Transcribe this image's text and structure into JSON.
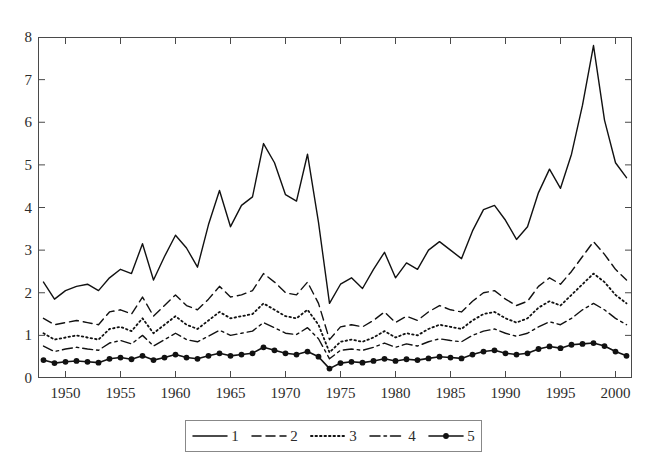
{
  "chart": {
    "title": "",
    "axis": {
      "yticks": [
        "0",
        "1",
        "2",
        "3",
        "4",
        "5",
        "6",
        "7",
        "8"
      ],
      "xticks": [
        "1950",
        "1955",
        "1960",
        "1965",
        "1970",
        "1975",
        "1980",
        "1985",
        "1990",
        "1995",
        "2000"
      ]
    }
  },
  "legend": {
    "items": [
      {
        "label": "1",
        "style": "solid",
        "marker": false
      },
      {
        "label": "2",
        "style": "dashed",
        "marker": false
      },
      {
        "label": "3",
        "style": "dotted",
        "marker": false
      },
      {
        "label": "4",
        "style": "dashdot",
        "marker": false
      },
      {
        "label": "5",
        "style": "solid",
        "marker": true
      }
    ]
  },
  "chart_data": {
    "type": "line",
    "title": "",
    "xlabel": "",
    "ylabel": "",
    "xlim": [
      1947.5,
      2001.5
    ],
    "ylim": [
      0,
      8
    ],
    "grid": false,
    "legend_position": "below",
    "x": [
      1948,
      1949,
      1950,
      1951,
      1952,
      1953,
      1954,
      1955,
      1956,
      1957,
      1958,
      1959,
      1960,
      1961,
      1962,
      1963,
      1964,
      1965,
      1966,
      1967,
      1968,
      1969,
      1970,
      1971,
      1972,
      1973,
      1974,
      1975,
      1976,
      1977,
      1978,
      1979,
      1980,
      1981,
      1982,
      1983,
      1984,
      1985,
      1986,
      1987,
      1988,
      1989,
      1990,
      1991,
      1992,
      1993,
      1994,
      1995,
      1996,
      1997,
      1998,
      1999,
      2000,
      2001
    ],
    "series": [
      {
        "name": "1",
        "style": "solid",
        "marker": false,
        "values": [
          2.25,
          1.85,
          2.05,
          2.15,
          2.2,
          2.05,
          2.35,
          2.55,
          2.45,
          3.15,
          2.3,
          2.85,
          3.35,
          3.05,
          2.6,
          3.6,
          4.4,
          3.55,
          4.05,
          4.25,
          5.5,
          5.05,
          4.3,
          4.15,
          5.25,
          3.65,
          1.75,
          2.2,
          2.35,
          2.1,
          2.55,
          2.95,
          2.35,
          2.7,
          2.55,
          3.0,
          3.2,
          3.0,
          2.8,
          3.45,
          3.95,
          4.05,
          3.7,
          3.25,
          3.55,
          4.35,
          4.9,
          4.45,
          5.25,
          6.4,
          7.8,
          6.05,
          5.05,
          4.7
        ]
      },
      {
        "name": "2",
        "style": "dashed",
        "marker": false,
        "values": [
          1.4,
          1.25,
          1.3,
          1.35,
          1.3,
          1.25,
          1.55,
          1.6,
          1.5,
          1.9,
          1.45,
          1.7,
          1.95,
          1.7,
          1.6,
          1.85,
          2.15,
          1.9,
          1.95,
          2.05,
          2.45,
          2.25,
          2.0,
          1.95,
          2.25,
          1.75,
          0.9,
          1.2,
          1.25,
          1.2,
          1.35,
          1.55,
          1.3,
          1.45,
          1.35,
          1.55,
          1.7,
          1.6,
          1.55,
          1.8,
          2.0,
          2.05,
          1.85,
          1.7,
          1.8,
          2.15,
          2.35,
          2.2,
          2.5,
          2.85,
          3.2,
          2.9,
          2.55,
          2.3
        ]
      },
      {
        "name": "3",
        "style": "dotted",
        "marker": false,
        "values": [
          1.05,
          0.9,
          0.95,
          1.0,
          0.95,
          0.9,
          1.15,
          1.2,
          1.1,
          1.4,
          1.05,
          1.25,
          1.45,
          1.25,
          1.15,
          1.35,
          1.55,
          1.4,
          1.45,
          1.5,
          1.75,
          1.6,
          1.45,
          1.4,
          1.6,
          1.25,
          0.6,
          0.85,
          0.9,
          0.85,
          0.95,
          1.1,
          0.95,
          1.05,
          1.0,
          1.15,
          1.25,
          1.2,
          1.15,
          1.35,
          1.5,
          1.55,
          1.4,
          1.3,
          1.4,
          1.65,
          1.8,
          1.7,
          1.95,
          2.2,
          2.45,
          2.25,
          1.95,
          1.75
        ]
      },
      {
        "name": "4",
        "style": "dashdot",
        "marker": false,
        "values": [
          0.75,
          0.62,
          0.68,
          0.72,
          0.68,
          0.65,
          0.82,
          0.88,
          0.8,
          1.0,
          0.75,
          0.9,
          1.05,
          0.9,
          0.85,
          0.98,
          1.12,
          1.0,
          1.05,
          1.1,
          1.3,
          1.18,
          1.05,
          1.02,
          1.18,
          0.92,
          0.45,
          0.65,
          0.68,
          0.65,
          0.72,
          0.82,
          0.72,
          0.8,
          0.75,
          0.85,
          0.92,
          0.88,
          0.85,
          1.0,
          1.1,
          1.15,
          1.05,
          0.98,
          1.05,
          1.2,
          1.32,
          1.25,
          1.4,
          1.6,
          1.75,
          1.6,
          1.4,
          1.25
        ]
      },
      {
        "name": "5",
        "style": "solid",
        "marker": true,
        "values": [
          0.42,
          0.35,
          0.38,
          0.4,
          0.38,
          0.36,
          0.45,
          0.48,
          0.44,
          0.52,
          0.42,
          0.48,
          0.55,
          0.48,
          0.45,
          0.52,
          0.58,
          0.52,
          0.55,
          0.58,
          0.72,
          0.65,
          0.58,
          0.55,
          0.62,
          0.5,
          0.22,
          0.35,
          0.38,
          0.36,
          0.4,
          0.45,
          0.4,
          0.44,
          0.42,
          0.46,
          0.5,
          0.48,
          0.46,
          0.55,
          0.62,
          0.65,
          0.58,
          0.55,
          0.58,
          0.68,
          0.74,
          0.7,
          0.78,
          0.8,
          0.82,
          0.75,
          0.62,
          0.52
        ]
      }
    ]
  }
}
